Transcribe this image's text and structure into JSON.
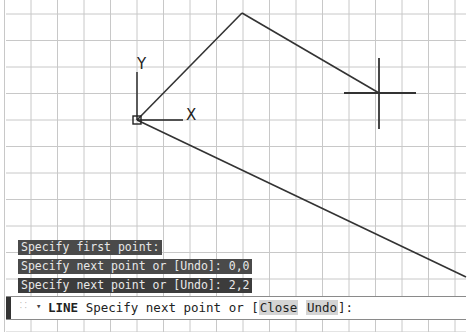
{
  "viewport": {
    "ucs_icon": {
      "x_label": "X",
      "y_label": "Y"
    },
    "colors": {
      "background": "#ffffff",
      "grid": "#c8c8c8",
      "geometry": "#333333",
      "crosshair": "#333333"
    }
  },
  "command_history": [
    "Specify first point:",
    "Specify next point or [Undo]: 0,0",
    "Specify next point or [Undo]: 2,2"
  ],
  "command_line": {
    "command": "LINE",
    "prompt": "Specify next point or [",
    "options": [
      "Close",
      "Undo"
    ],
    "suffix": "]:"
  }
}
